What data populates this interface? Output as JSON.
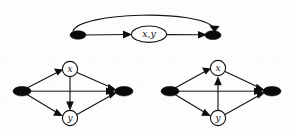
{
  "figure": {
    "type": "directed-graph-diagram",
    "background_color": "#fdfdfc",
    "ink_color": "#101010",
    "width": 296,
    "height": 134,
    "panels": [
      {
        "id": "top",
        "name": "top-graph",
        "nodes": [
          {
            "id": "t-source",
            "kind": "solid",
            "label": "",
            "cx": 78,
            "cy": 35,
            "rx": 7.5,
            "ry": 4.0
          },
          {
            "id": "t-xy",
            "kind": "ellipse",
            "label": "x,y",
            "cx": 149,
            "cy": 34,
            "rx": 17.5,
            "ry": 8.0
          },
          {
            "id": "t-sink",
            "kind": "solid",
            "label": "",
            "cx": 213,
            "cy": 35,
            "rx": 7.5,
            "ry": 4.0
          }
        ],
        "edges": [
          {
            "from": "t-source",
            "to": "t-xy",
            "shape": "straight",
            "arrow": "to"
          },
          {
            "from": "t-xy",
            "to": "t-sink",
            "shape": "straight",
            "arrow": "to"
          },
          {
            "from": "t-source",
            "to": "t-sink",
            "shape": "arc-above",
            "arrow": "to"
          }
        ]
      },
      {
        "id": "bottom-left",
        "name": "bottom-left-graph",
        "nodes": [
          {
            "id": "bl-source",
            "kind": "solid",
            "label": "",
            "cx": 22,
            "cy": 91,
            "rx": 8.5,
            "ry": 4.5
          },
          {
            "id": "bl-x",
            "kind": "circle",
            "label": "x",
            "cx": 70,
            "cy": 69,
            "r": 7.5
          },
          {
            "id": "bl-y",
            "kind": "circle",
            "label": "y",
            "cx": 70,
            "cy": 118,
            "r": 7.5
          },
          {
            "id": "bl-sink",
            "kind": "solid",
            "label": "",
            "cx": 124,
            "cy": 91,
            "rx": 8.5,
            "ry": 4.5
          }
        ],
        "edges": [
          {
            "from": "bl-source",
            "to": "bl-x",
            "shape": "straight",
            "arrow": "to"
          },
          {
            "from": "bl-source",
            "to": "bl-y",
            "shape": "straight",
            "arrow": "to"
          },
          {
            "from": "bl-x",
            "to": "bl-sink",
            "shape": "straight",
            "arrow": "to"
          },
          {
            "from": "bl-y",
            "to": "bl-sink",
            "shape": "straight",
            "arrow": "to"
          },
          {
            "from": "bl-source",
            "to": "bl-sink",
            "shape": "straight-horizontal",
            "arrow": "to"
          },
          {
            "from": "bl-x",
            "to": "bl-y",
            "shape": "straight-vertical",
            "arrow": "to",
            "direction": "down"
          }
        ]
      },
      {
        "id": "bottom-right",
        "name": "bottom-right-graph",
        "nodes": [
          {
            "id": "br-source",
            "kind": "solid",
            "label": "",
            "cx": 170,
            "cy": 91,
            "rx": 8.5,
            "ry": 4.5
          },
          {
            "id": "br-x",
            "kind": "circle",
            "label": "x",
            "cx": 218,
            "cy": 68,
            "r": 7.5
          },
          {
            "id": "br-y",
            "kind": "circle",
            "label": "y",
            "cx": 218,
            "cy": 118,
            "r": 7.5
          },
          {
            "id": "br-sink",
            "kind": "solid",
            "label": "",
            "cx": 272,
            "cy": 91,
            "rx": 8.5,
            "ry": 4.5
          }
        ],
        "edges": [
          {
            "from": "br-source",
            "to": "br-x",
            "shape": "straight",
            "arrow": "to"
          },
          {
            "from": "br-source",
            "to": "br-y",
            "shape": "straight",
            "arrow": "to"
          },
          {
            "from": "br-x",
            "to": "br-sink",
            "shape": "straight",
            "arrow": "to"
          },
          {
            "from": "br-y",
            "to": "br-sink",
            "shape": "straight",
            "arrow": "to"
          },
          {
            "from": "br-source",
            "to": "br-sink",
            "shape": "straight-horizontal",
            "arrow": "to"
          },
          {
            "from": "br-y",
            "to": "br-x",
            "shape": "straight-vertical",
            "arrow": "to",
            "direction": "up"
          }
        ]
      }
    ],
    "labels": {
      "top_pair": "x,y",
      "left_x": "x",
      "left_y": "y",
      "right_x": "x",
      "right_y": "y"
    }
  }
}
